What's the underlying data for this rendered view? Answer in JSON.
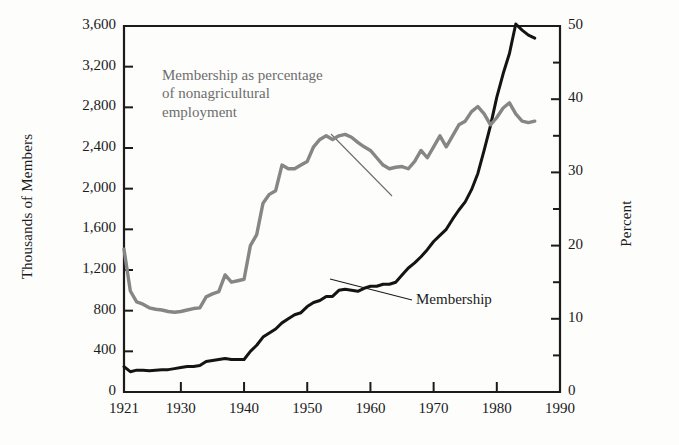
{
  "chart_data": {
    "type": "line",
    "title": "",
    "subtitle": "",
    "xlabel": "",
    "ylabel": "Thousands of Members",
    "y2label": "Percent",
    "xlim": [
      1921,
      1990
    ],
    "ylim": [
      0,
      3600
    ],
    "y2lim": [
      0,
      50
    ],
    "grid": false,
    "legend_position": "inline annotations with leader lines",
    "x_ticks": [
      "1921",
      "1930",
      "1940",
      "1950",
      "1960",
      "1970",
      "1980",
      "1990"
    ],
    "x_tick_values": [
      1921,
      1930,
      1940,
      1950,
      1960,
      1970,
      1980,
      1990
    ],
    "y_ticks": [
      "0",
      "400",
      "800",
      "1,200",
      "1,600",
      "2,000",
      "2,400",
      "2,800",
      "3,200",
      "3,600"
    ],
    "y_tick_values": [
      0,
      400,
      800,
      1200,
      1600,
      2000,
      2400,
      2800,
      3200,
      3600
    ],
    "y2_ticks": [
      "0",
      "10",
      "20",
      "30",
      "40",
      "50"
    ],
    "y2_tick_values": [
      0,
      10,
      20,
      30,
      40,
      50
    ],
    "y2_minor_tick_values": [
      5,
      15,
      25,
      35,
      45
    ],
    "annotations": [
      {
        "name": "percentage-series-label",
        "text": "Membership as percentage\nof nonagricultural\nemployment",
        "color": "#6d6d6d",
        "leader_from": [
          331,
          134
        ],
        "leader_to": [
          392,
          196
        ]
      },
      {
        "name": "membership-series-label",
        "text": "Membership",
        "color": "#1b1b1b",
        "leader_from": [
          412,
          300
        ],
        "leader_to": [
          330,
          279
        ]
      }
    ],
    "series": [
      {
        "name": "Membership",
        "axis": "left",
        "unit": "thousands of members",
        "color": "#141414",
        "x": [
          1921,
          1922,
          1923,
          1924,
          1925,
          1926,
          1927,
          1928,
          1929,
          1930,
          1931,
          1932,
          1933,
          1934,
          1935,
          1936,
          1937,
          1938,
          1939,
          1940,
          1941,
          1942,
          1943,
          1944,
          1945,
          1946,
          1947,
          1948,
          1949,
          1950,
          1951,
          1952,
          1953,
          1954,
          1955,
          1956,
          1957,
          1958,
          1959,
          1960,
          1961,
          1962,
          1963,
          1964,
          1965,
          1966,
          1967,
          1968,
          1969,
          1970,
          1971,
          1972,
          1973,
          1974,
          1975,
          1976,
          1977,
          1978,
          1979,
          1980,
          1981,
          1982,
          1983,
          1984,
          1985,
          1986
        ],
        "values": [
          250,
          200,
          215,
          215,
          210,
          215,
          220,
          220,
          230,
          240,
          250,
          250,
          260,
          300,
          310,
          320,
          330,
          320,
          320,
          320,
          400,
          460,
          540,
          580,
          620,
          680,
          720,
          760,
          780,
          840,
          880,
          900,
          940,
          940,
          1000,
          1010,
          1000,
          990,
          1020,
          1040,
          1040,
          1060,
          1060,
          1080,
          1150,
          1220,
          1270,
          1330,
          1400,
          1480,
          1540,
          1600,
          1700,
          1790,
          1870,
          1990,
          2150,
          2380,
          2620,
          2900,
          3130,
          3330,
          3620,
          3560,
          3510,
          3480
        ]
      },
      {
        "name": "Membership as percentage of nonagricultural employment",
        "axis": "right",
        "unit": "percent",
        "color": "#868686",
        "x": [
          1921,
          1922,
          1923,
          1924,
          1925,
          1926,
          1927,
          1928,
          1929,
          1930,
          1931,
          1932,
          1933,
          1934,
          1935,
          1936,
          1937,
          1938,
          1939,
          1940,
          1941,
          1942,
          1943,
          1944,
          1945,
          1946,
          1947,
          1948,
          1949,
          1950,
          1951,
          1952,
          1953,
          1954,
          1955,
          1956,
          1957,
          1958,
          1959,
          1960,
          1961,
          1962,
          1963,
          1964,
          1965,
          1966,
          1967,
          1968,
          1969,
          1970,
          1971,
          1972,
          1973,
          1974,
          1975,
          1976,
          1977,
          1978,
          1979,
          1980,
          1981,
          1982,
          1983,
          1984,
          1985,
          1986
        ],
        "values": [
          19.5,
          13.8,
          12.3,
          12.0,
          11.5,
          11.3,
          11.2,
          11.0,
          10.9,
          11.0,
          11.2,
          11.4,
          11.5,
          13.0,
          13.4,
          13.7,
          16.0,
          15.0,
          15.2,
          15.4,
          20.0,
          21.5,
          25.8,
          27.0,
          27.5,
          31.0,
          30.5,
          30.5,
          31.0,
          31.5,
          33.5,
          34.5,
          35.0,
          34.5,
          35.0,
          35.2,
          34.8,
          34.1,
          33.5,
          33.0,
          32.0,
          31.0,
          30.5,
          30.7,
          30.8,
          30.5,
          31.5,
          33.0,
          32.0,
          33.5,
          35.0,
          33.5,
          35.0,
          36.5,
          37.0,
          38.3,
          39.0,
          38.0,
          36.5,
          37.5,
          38.8,
          39.5,
          38.0,
          37.0,
          36.8,
          37.0
        ]
      }
    ]
  },
  "axes": {
    "left_title": "Thousands of Members",
    "right_title": "Percent"
  },
  "colors": {
    "membership_line": "#141414",
    "percentage_line": "#868686",
    "frame": "#1b1b1b",
    "background": "#fdfdfc"
  }
}
